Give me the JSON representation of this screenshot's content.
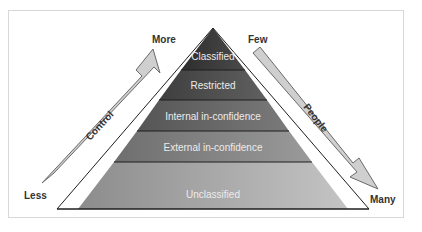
{
  "diagram": {
    "type": "pyramid",
    "levels": [
      {
        "label": "Classified",
        "color": "#3e3e3e"
      },
      {
        "label": "Restricted",
        "color": "#525252"
      },
      {
        "label": "Internal in-confidence",
        "color": "#6a6a6a"
      },
      {
        "label": "External in-confidence",
        "color": "#858585"
      },
      {
        "label": "Unclassified",
        "color": "#a4a4a4"
      }
    ],
    "left_arrow": {
      "label": "Control",
      "top_label": "More",
      "bottom_label": "Less",
      "direction": "up"
    },
    "right_arrow": {
      "label": "People",
      "top_label": "Few",
      "bottom_label": "Many",
      "direction": "down"
    }
  }
}
